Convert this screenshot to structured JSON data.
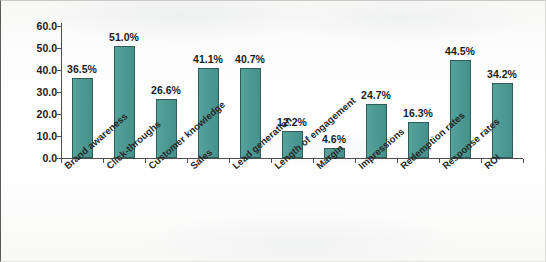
{
  "chart_data": {
    "type": "bar",
    "title": "",
    "subtitle": "",
    "xlabel": "",
    "ylabel": "Percent (%)",
    "ylim": [
      0.0,
      60.0
    ],
    "ytick_step": 10.0,
    "ytick_labels": [
      "60.0",
      "50.0",
      "40.0",
      "30.0",
      "20.0",
      "10.0",
      "0.0"
    ],
    "ytick_values": [
      60.0,
      50.0,
      40.0,
      30.0,
      20.0,
      10.0,
      0.0
    ],
    "grid": false,
    "legend": null,
    "legend_position": "none",
    "value_label_suffix": "%",
    "bar_color": "#4e9b95",
    "bar_edge_color": "#2f5d59",
    "axis_color": "#4e4e4c",
    "categories": [
      "Brand awareness",
      "Click-throughs",
      "Customer knowledge",
      "Sales",
      "Lead generation",
      "Length of engagement",
      "Margin",
      "Impressions",
      "Redemption rates",
      "Response rates",
      "ROI"
    ],
    "values": [
      36.5,
      51.0,
      26.6,
      41.1,
      40.7,
      12.2,
      4.6,
      24.7,
      16.3,
      44.5,
      34.2
    ],
    "value_labels": [
      "36.5%",
      "51.0%",
      "26.6%",
      "41.1%",
      "40.7%",
      "12.2%",
      "4.6%",
      "24.7%",
      "16.3%",
      "44.5%",
      "34.2%"
    ]
  }
}
